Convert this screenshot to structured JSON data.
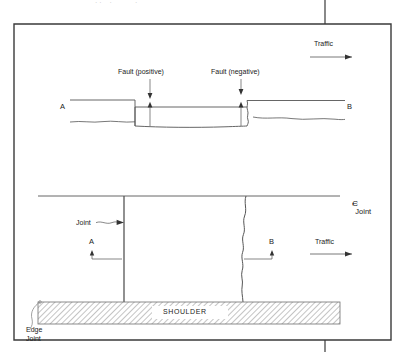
{
  "figure": {
    "kind": "engineering-diagram",
    "border_color": "#3a3a3a",
    "line_color": "#555555",
    "text_color": "#1a1a1a",
    "hatch_color": "#8a8a8a"
  },
  "profile_view": {
    "traffic_label": "Traffic",
    "fault_positive_label": "Fault (positive)",
    "fault_negative_label": "Fault (negative)",
    "station_a_label": "A",
    "station_b_label": "B"
  },
  "plan_view": {
    "centerline_symbol": "C",
    "centerline_joint_label": "Joint",
    "joint_label": "Joint",
    "station_a_label": "A",
    "station_b_label": "B",
    "traffic_label": "Traffic",
    "shoulder_label": "SHOULDER",
    "edge_joint_label_line1": "Edge",
    "edge_joint_label_line2": "Joint"
  },
  "page_artifacts": {
    "cropped_header_text": "· ·    ·            ·"
  }
}
